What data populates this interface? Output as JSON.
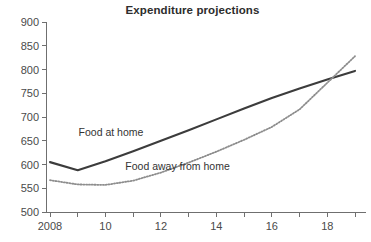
{
  "chart_data": {
    "type": "line",
    "title": "Expenditure projections",
    "xlabel": "",
    "ylabel": "",
    "xlim": [
      2008,
      2019
    ],
    "ylim": [
      500,
      900
    ],
    "grid": false,
    "legend_position": "inline-annotations",
    "y_ticks": [
      500,
      550,
      600,
      650,
      700,
      750,
      800,
      850,
      900
    ],
    "y_tick_labels": [
      "500",
      "550",
      "600",
      "650",
      "700",
      "750",
      "800",
      "850",
      "900"
    ],
    "x_ticks": [
      2008,
      2009,
      2010,
      2011,
      2012,
      2013,
      2014,
      2015,
      2016,
      2017,
      2018,
      2019
    ],
    "x_tick_labels": [
      "2008",
      "",
      "10",
      "",
      "12",
      "",
      "14",
      "",
      "16",
      "",
      "18",
      ""
    ],
    "x": [
      2008,
      2009,
      2010,
      2011,
      2012,
      2013,
      2014,
      2015,
      2016,
      2017,
      2018,
      2019
    ],
    "series": [
      {
        "name": "Food at home",
        "style": "solid",
        "color": "#3c3c3c",
        "label_x": 2010.2,
        "label_y": 660,
        "values": [
          605,
          588,
          607,
          628,
          650,
          672,
          695,
          718,
          740,
          760,
          779,
          797
        ]
      },
      {
        "name": "Food away from home",
        "style": "dotted",
        "color": "#8d8d8d",
        "label_x": 2012.6,
        "label_y": 588,
        "values": [
          567,
          558,
          557,
          566,
          583,
          604,
          627,
          652,
          679,
          716,
          772,
          828
        ]
      }
    ]
  }
}
